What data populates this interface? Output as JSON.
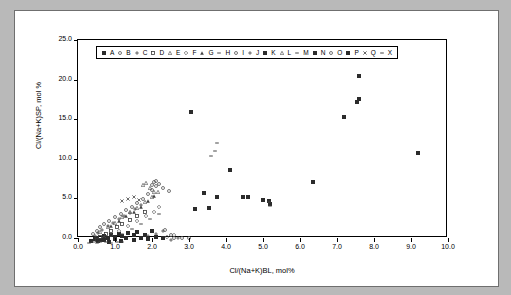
{
  "chart_data": {
    "type": "scatter",
    "title": "",
    "xlabel": "Cl/(Na+K)BL, mol%",
    "ylabel": "Cl/(Na+K)SP, mol %",
    "xlim": [
      0.0,
      10.0
    ],
    "ylim": [
      0.0,
      25.0
    ],
    "xticks": [
      "0.0",
      "1.0",
      "2.0",
      "3.0",
      "4.0",
      "5.0",
      "6.0",
      "7.0",
      "8.0",
      "9.0",
      "10.0"
    ],
    "yticks": [
      "0.0",
      "5.0",
      "10.0",
      "15.0",
      "20.0",
      "25.0"
    ],
    "grid": false,
    "legend_position": "top-left-inside",
    "series": [
      {
        "name": "A",
        "marker": "filled-square",
        "points": [
          [
            0.35,
            0.9
          ],
          [
            0.45,
            1.1
          ],
          [
            0.5,
            1.3
          ],
          [
            0.6,
            1.0
          ],
          [
            0.7,
            1.5
          ],
          [
            0.8,
            1.2
          ],
          [
            0.9,
            1.6
          ],
          [
            1.0,
            1.4
          ],
          [
            1.1,
            1.8
          ],
          [
            1.2,
            1.5
          ],
          [
            1.35,
            1.9
          ],
          [
            1.5,
            1.6
          ],
          [
            1.6,
            2.0
          ],
          [
            1.8,
            1.7
          ],
          [
            2.0,
            2.1
          ]
        ]
      },
      {
        "name": "B",
        "marker": "open-circle",
        "points": [
          [
            0.4,
            1.8
          ],
          [
            0.5,
            2.2
          ],
          [
            0.6,
            2.6
          ],
          [
            0.7,
            3.0
          ],
          [
            0.85,
            3.4
          ],
          [
            1.0,
            3.9
          ],
          [
            1.15,
            4.3
          ],
          [
            1.3,
            4.8
          ],
          [
            1.45,
            5.2
          ],
          [
            1.6,
            5.7
          ],
          [
            1.75,
            6.2
          ],
          [
            1.9,
            6.8
          ],
          [
            2.0,
            7.3
          ],
          [
            2.1,
            7.8
          ]
        ]
      },
      {
        "name": "C",
        "marker": "plus",
        "points": [
          [
            0.45,
            1.5
          ],
          [
            0.55,
            1.9
          ],
          [
            0.65,
            2.3
          ],
          [
            0.8,
            2.8
          ],
          [
            0.95,
            3.2
          ],
          [
            1.1,
            3.6
          ],
          [
            1.25,
            4.0
          ],
          [
            1.4,
            4.4
          ],
          [
            1.55,
            4.9
          ],
          [
            1.7,
            5.4
          ]
        ]
      },
      {
        "name": "D",
        "marker": "open-square",
        "points": [
          [
            0.5,
            1.0
          ],
          [
            0.6,
            1.4
          ],
          [
            0.75,
            1.8
          ],
          [
            0.9,
            2.2
          ],
          [
            1.05,
            2.6
          ],
          [
            1.2,
            3.0
          ],
          [
            1.4,
            3.5
          ],
          [
            1.6,
            4.0
          ],
          [
            1.8,
            4.6
          ]
        ]
      },
      {
        "name": "E",
        "marker": "open-triangle",
        "points": [
          [
            0.6,
            2.0
          ],
          [
            0.8,
            2.6
          ],
          [
            1.0,
            3.2
          ],
          [
            1.2,
            3.9
          ],
          [
            1.4,
            4.5
          ],
          [
            1.6,
            5.1
          ],
          [
            1.8,
            5.8
          ],
          [
            2.0,
            6.4
          ],
          [
            2.15,
            7.1
          ]
        ]
      },
      {
        "name": "F",
        "marker": "open-diamond",
        "points": [
          [
            0.7,
            1.2
          ],
          [
            0.9,
            1.7
          ],
          [
            1.1,
            2.2
          ],
          [
            1.35,
            2.8
          ],
          [
            1.6,
            3.4
          ],
          [
            1.85,
            4.0
          ],
          [
            2.05,
            4.6
          ],
          [
            2.2,
            5.2
          ],
          [
            2.4,
            1.4
          ],
          [
            2.6,
            1.6
          ]
        ]
      },
      {
        "name": "G",
        "marker": "filled-triangle",
        "points": [
          [
            0.9,
            2.8
          ],
          [
            1.1,
            3.4
          ],
          [
            1.3,
            4.0
          ],
          [
            1.5,
            4.6
          ],
          [
            1.7,
            5.2
          ],
          [
            1.9,
            5.9
          ],
          [
            2.05,
            6.6
          ]
        ]
      },
      {
        "name": "H",
        "marker": "dash",
        "points": [
          [
            1.0,
            1.3
          ],
          [
            1.2,
            1.8
          ],
          [
            1.45,
            2.4
          ],
          [
            1.7,
            3.0
          ],
          [
            1.95,
            3.7
          ],
          [
            2.2,
            4.3
          ]
        ]
      },
      {
        "name": "I",
        "marker": "open-circle",
        "points": [
          [
            2.0,
            8.0
          ],
          [
            2.05,
            8.3
          ],
          [
            2.1,
            8.5
          ],
          [
            2.2,
            8.1
          ],
          [
            2.3,
            7.6
          ],
          [
            2.45,
            7.2
          ]
        ]
      },
      {
        "name": "J",
        "marker": "plus",
        "points": [
          [
            1.5,
            1.0
          ],
          [
            1.7,
            1.2
          ],
          [
            1.9,
            1.5
          ],
          [
            2.1,
            1.8
          ],
          [
            2.3,
            2.1
          ],
          [
            2.5,
            1.0
          ],
          [
            2.7,
            1.2
          ]
        ]
      },
      {
        "name": "K",
        "marker": "filled-square",
        "points": [
          [
            3.15,
            4.9
          ],
          [
            3.4,
            6.9
          ],
          [
            3.55,
            5.0
          ],
          [
            3.75,
            6.5
          ],
          [
            4.1,
            9.9
          ],
          [
            4.45,
            6.5
          ],
          [
            4.6,
            6.4
          ],
          [
            5.0,
            6.0
          ],
          [
            5.15,
            5.9
          ],
          [
            5.2,
            5.6
          ],
          [
            6.35,
            8.3
          ],
          [
            7.2,
            16.6
          ],
          [
            7.55,
            18.4
          ],
          [
            7.6,
            18.8
          ],
          [
            7.6,
            21.7
          ],
          [
            9.2,
            12.0
          ]
        ]
      },
      {
        "name": "L",
        "marker": "open-triangle",
        "points": [
          [
            1.75,
            7.9
          ],
          [
            1.85,
            8.2
          ],
          [
            1.95,
            7.6
          ],
          [
            2.05,
            7.1
          ]
        ]
      },
      {
        "name": "M",
        "marker": "dash",
        "points": [
          [
            3.6,
            11.6
          ],
          [
            3.7,
            12.3
          ],
          [
            3.75,
            13.2
          ],
          [
            5.15,
            5.8
          ],
          [
            5.2,
            5.3
          ]
        ]
      },
      {
        "name": "N",
        "marker": "filled-square",
        "points": [
          [
            0.55,
            0.9
          ],
          [
            0.7,
            1.0
          ],
          [
            0.85,
            0.8
          ],
          [
            1.0,
            1.1
          ],
          [
            1.15,
            0.9
          ],
          [
            1.3,
            1.2
          ],
          [
            1.5,
            1.0
          ],
          [
            1.7,
            1.3
          ],
          [
            1.9,
            1.1
          ],
          [
            2.1,
            1.4
          ],
          [
            2.3,
            1.2
          ]
        ]
      },
      {
        "name": "O",
        "marker": "open-circle",
        "points": [
          [
            2.35,
            2.3
          ],
          [
            2.5,
            1.6
          ],
          [
            2.6,
            1.3
          ],
          [
            2.8,
            1.2
          ],
          [
            3.0,
            1.3
          ]
        ]
      },
      {
        "name": "P",
        "marker": "filled-square",
        "points": [
          [
            3.05,
            17.2
          ]
        ]
      },
      {
        "name": "Q",
        "marker": "cross",
        "points": [
          [
            1.2,
            5.9
          ],
          [
            1.35,
            6.2
          ],
          [
            1.5,
            6.4
          ],
          [
            1.65,
            6.0
          ]
        ]
      },
      {
        "name": "X",
        "marker": "dash",
        "points": [
          [
            0.3,
            0.6
          ],
          [
            0.4,
            0.7
          ],
          [
            0.5,
            0.6
          ],
          [
            0.6,
            0.8
          ],
          [
            0.75,
            0.7
          ],
          [
            0.9,
            0.6
          ],
          [
            1.05,
            0.8
          ],
          [
            1.2,
            0.7
          ]
        ]
      }
    ]
  },
  "legend": {
    "entries": [
      {
        "label": "A",
        "marker": "filled-square"
      },
      {
        "label": "B",
        "marker": "open-circle"
      },
      {
        "label": "C",
        "marker": "plus"
      },
      {
        "label": "D",
        "marker": "open-square"
      },
      {
        "label": "E",
        "marker": "open-triangle"
      },
      {
        "label": "F",
        "marker": "open-diamond"
      },
      {
        "label": "G",
        "marker": "filled-triangle"
      },
      {
        "label": "H",
        "marker": "dash"
      },
      {
        "label": "I",
        "marker": "open-circle"
      },
      {
        "label": "J",
        "marker": "plus"
      },
      {
        "label": "K",
        "marker": "filled-square"
      },
      {
        "label": "L",
        "marker": "open-triangle"
      },
      {
        "label": "M",
        "marker": "dash"
      },
      {
        "label": "N",
        "marker": "filled-square"
      },
      {
        "label": "O",
        "marker": "open-circle"
      },
      {
        "label": "P",
        "marker": "filled-square"
      },
      {
        "label": "Q",
        "marker": "cross"
      },
      {
        "label": "X",
        "marker": "dash"
      }
    ]
  }
}
